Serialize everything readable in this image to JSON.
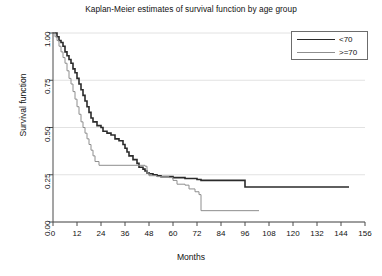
{
  "chart_data": {
    "type": "line",
    "title": "Kaplan-Meier estimates of survival function by age group",
    "xlabel": "Months",
    "ylabel": "Survival function",
    "xlim": [
      0,
      156
    ],
    "ylim": [
      0,
      1.0
    ],
    "xticks": [
      0,
      12,
      24,
      36,
      48,
      60,
      72,
      84,
      96,
      108,
      120,
      132,
      144,
      156
    ],
    "yticks": [
      "0.00",
      "0.25",
      "0.50",
      "0.75",
      "1.00"
    ],
    "ytick_values": [
      0.0,
      0.25,
      0.5,
      0.75,
      1.0
    ],
    "grid": "horizontal",
    "legend_position": "top-right",
    "step_type": "post",
    "series": [
      {
        "name": "<70",
        "color": "#2b2b2b",
        "width": 1.6,
        "points": [
          [
            0,
            1.0
          ],
          [
            2,
            0.98
          ],
          [
            3,
            0.96
          ],
          [
            4,
            0.95
          ],
          [
            5,
            0.93
          ],
          [
            6,
            0.9
          ],
          [
            7,
            0.88
          ],
          [
            8,
            0.86
          ],
          [
            9,
            0.84
          ],
          [
            10,
            0.81
          ],
          [
            11,
            0.79
          ],
          [
            12,
            0.76
          ],
          [
            13,
            0.73
          ],
          [
            14,
            0.7
          ],
          [
            15,
            0.67
          ],
          [
            16,
            0.64
          ],
          [
            17,
            0.61
          ],
          [
            18,
            0.58
          ],
          [
            19,
            0.55
          ],
          [
            20,
            0.53
          ],
          [
            22,
            0.51
          ],
          [
            24,
            0.5
          ],
          [
            25,
            0.48
          ],
          [
            27,
            0.47
          ],
          [
            29,
            0.46
          ],
          [
            31,
            0.44
          ],
          [
            33,
            0.43
          ],
          [
            35,
            0.41
          ],
          [
            36,
            0.39
          ],
          [
            37,
            0.37
          ],
          [
            38,
            0.35
          ],
          [
            40,
            0.33
          ],
          [
            42,
            0.31
          ],
          [
            43,
            0.29
          ],
          [
            45,
            0.28
          ],
          [
            46,
            0.27
          ],
          [
            47,
            0.26
          ],
          [
            48,
            0.255
          ],
          [
            50,
            0.25
          ],
          [
            52,
            0.245
          ],
          [
            54,
            0.24
          ],
          [
            60,
            0.235
          ],
          [
            62,
            0.235
          ],
          [
            66,
            0.23
          ],
          [
            72,
            0.225
          ],
          [
            74,
            0.22
          ],
          [
            80,
            0.22
          ],
          [
            95,
            0.22
          ],
          [
            96,
            0.185
          ],
          [
            148,
            0.185
          ]
        ]
      },
      {
        "name": ">=70",
        "color": "#8e8e8e",
        "width": 1.0,
        "points": [
          [
            0,
            1.0
          ],
          [
            1,
            0.98
          ],
          [
            2,
            0.96
          ],
          [
            3,
            0.93
          ],
          [
            4,
            0.9
          ],
          [
            5,
            0.87
          ],
          [
            6,
            0.84
          ],
          [
            7,
            0.8
          ],
          [
            8,
            0.76
          ],
          [
            9,
            0.73
          ],
          [
            10,
            0.69
          ],
          [
            11,
            0.65
          ],
          [
            12,
            0.61
          ],
          [
            13,
            0.57
          ],
          [
            14,
            0.53
          ],
          [
            15,
            0.5
          ],
          [
            16,
            0.47
          ],
          [
            17,
            0.44
          ],
          [
            18,
            0.41
          ],
          [
            19,
            0.38
          ],
          [
            20,
            0.35
          ],
          [
            21,
            0.32
          ],
          [
            23,
            0.3
          ],
          [
            46,
            0.295
          ],
          [
            47,
            0.26
          ],
          [
            48,
            0.245
          ],
          [
            52,
            0.24
          ],
          [
            58,
            0.235
          ],
          [
            60,
            0.22
          ],
          [
            62,
            0.2
          ],
          [
            66,
            0.195
          ],
          [
            68,
            0.175
          ],
          [
            71,
            0.16
          ],
          [
            73,
            0.145
          ],
          [
            74,
            0.06
          ],
          [
            103,
            0.06
          ]
        ]
      }
    ]
  },
  "legend": {
    "items": [
      {
        "label": "<70"
      },
      {
        "label": ">=70"
      }
    ]
  }
}
